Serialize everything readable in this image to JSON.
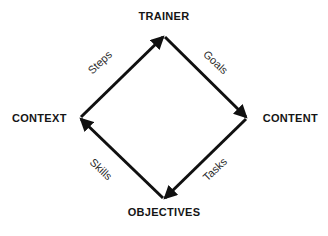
{
  "diagram": {
    "type": "cycle-diagram",
    "shape": "diamond",
    "background_color": "#ffffff",
    "stroke_color": "#101010",
    "nodes": {
      "top": "TRAINER",
      "right": "CONTENT",
      "bottom": "OBJECTIVES",
      "left": "CONTEXT"
    },
    "edges": {
      "left_to_top": "Steps",
      "top_to_right": "Goals",
      "right_to_bottom": "Tasks",
      "bottom_to_left": "Skills"
    }
  }
}
